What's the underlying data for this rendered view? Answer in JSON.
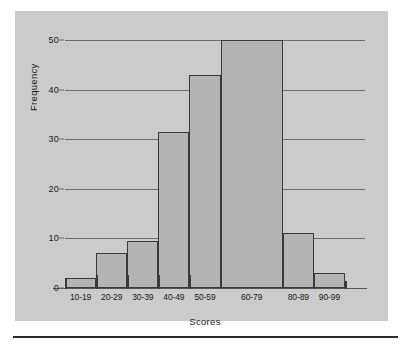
{
  "chart_data": {
    "type": "bar",
    "title": "",
    "xlabel": "Scores",
    "ylabel": "Frequency",
    "categories": [
      "10-19",
      "20-29",
      "30-39",
      "40-49",
      "50-59",
      "60-79",
      "80-89",
      "90-99"
    ],
    "values": [
      2,
      7,
      9.5,
      31.5,
      43,
      50,
      11,
      3
    ],
    "bar_widths": [
      1,
      1,
      1,
      1,
      1,
      2,
      1,
      1
    ],
    "ylim": [
      0,
      50
    ],
    "yticks": [
      0,
      10,
      20,
      30,
      40,
      50
    ],
    "grid": "horizontal",
    "legend": "none",
    "colors": {
      "panel_background": "#cbcbcb",
      "bar_fill": "#b4b4b4",
      "bar_border": "#3a3a3a",
      "gridline": "#6e6e6e",
      "text": "#1a1a1a",
      "page_background": "#ffffff",
      "rule": "#2a2a2a"
    }
  }
}
